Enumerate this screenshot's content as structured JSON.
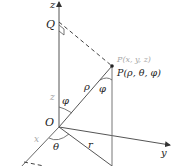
{
  "diagram": {
    "colors": {
      "line": "#555555",
      "light_line": "#888888",
      "grey_label": "#a8a8a8",
      "dark_label": "#222222",
      "background": "#ffffff"
    },
    "labels": {
      "z_axis": "z",
      "y_axis": "y",
      "x_axis": "x",
      "origin": "O",
      "q_point": "Q",
      "p_cartesian": "P(x, y, z)",
      "p_spherical": "P(ρ, θ, φ)",
      "rho": "ρ",
      "phi_origin": "φ",
      "phi_p": "φ",
      "theta": "θ",
      "r": "r",
      "z_height": "z"
    },
    "points": {
      "O": [
        59,
        127
      ],
      "Q": [
        59,
        26
      ],
      "P": [
        112,
        66
      ],
      "z_tip": [
        59,
        1
      ],
      "y_tip": [
        172,
        146
      ],
      "x_tip": [
        20,
        168
      ],
      "P_foot": [
        112,
        166
      ]
    }
  }
}
